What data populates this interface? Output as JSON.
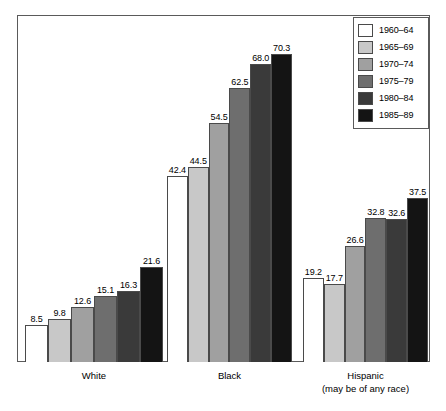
{
  "chart_data": {
    "type": "bar",
    "title": "",
    "subtitle": "",
    "xlabel": "",
    "ylabel": "",
    "ylim": [
      0,
      79
    ],
    "grid": false,
    "legend_position": "top-right",
    "categories": [
      "White",
      "Black",
      "Hispanic"
    ],
    "category_sublabels": [
      "",
      "",
      "(may be of any race)"
    ],
    "series": [
      {
        "name": "1960–64",
        "color": "#ffffff",
        "values": [
          8.5,
          42.4,
          19.2
        ]
      },
      {
        "name": "1965–69",
        "color": "#c8c8c8",
        "values": [
          9.8,
          44.5,
          17.7
        ]
      },
      {
        "name": "1970–74",
        "color": "#a0a0a0",
        "values": [
          12.6,
          54.5,
          26.6
        ]
      },
      {
        "name": "1975–79",
        "color": "#6e6e6e",
        "values": [
          15.1,
          62.5,
          32.8
        ]
      },
      {
        "name": "1980–84",
        "color": "#3a3a3a",
        "values": [
          16.3,
          68.0,
          32.6
        ]
      },
      {
        "name": "1985–89",
        "color": "#141414",
        "values": [
          21.6,
          70.3,
          37.5
        ]
      }
    ]
  },
  "legend": {
    "entries": [
      {
        "label": "1960–64"
      },
      {
        "label": "1965–69"
      },
      {
        "label": "1970–74"
      },
      {
        "label": "1975–79"
      },
      {
        "label": "1980–84"
      },
      {
        "label": "1985–89"
      }
    ]
  },
  "axis": {
    "categories": [
      {
        "label": "White",
        "sublabel": ""
      },
      {
        "label": "Black",
        "sublabel": ""
      },
      {
        "label": "Hispanic",
        "sublabel": "(may be of any race)"
      }
    ]
  }
}
